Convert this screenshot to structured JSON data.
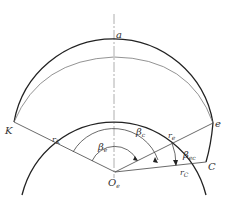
{
  "diagram": {
    "labels": {
      "top": "a",
      "left_point": "K",
      "right_point": "e",
      "lower_right_point": "C",
      "center_main": "O",
      "center_sub": "e",
      "rK_main": "r",
      "rK_sub": "K",
      "re_main": "r",
      "re_sub": "e",
      "rC_main": "r",
      "rC_sub": "C",
      "beta_outer_main": "β",
      "beta_outer_sub": "c",
      "beta_inner_main": "β",
      "beta_inner_sub": "e",
      "beta_ec_main": "β",
      "beta_ec_sub": "ec"
    },
    "colors": {
      "thick_line": "#222222",
      "thin_line": "#666666",
      "axis_line": "#999999"
    }
  }
}
